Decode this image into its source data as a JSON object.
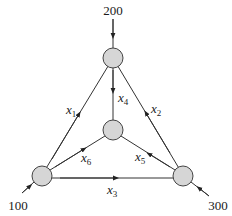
{
  "diagram": {
    "type": "network-flow",
    "colors": {
      "node_fill": "#d6d6d6",
      "stroke": "#333333"
    },
    "external_flows": {
      "top": {
        "label": "200",
        "direction": "in"
      },
      "bottom_left": {
        "label": "100",
        "direction": "in"
      },
      "bottom_right": {
        "label": "300",
        "direction": "out"
      }
    },
    "nodes": [
      "top",
      "center",
      "bottom-left",
      "bottom-right"
    ],
    "edges": [
      {
        "var": "x",
        "sub": "1",
        "from": "bottom-left",
        "to": "top"
      },
      {
        "var": "x",
        "sub": "2",
        "from": "bottom-right",
        "to": "top"
      },
      {
        "var": "x",
        "sub": "3",
        "from": "bottom-left",
        "to": "bottom-right"
      },
      {
        "var": "x",
        "sub": "4",
        "from": "top",
        "to": "center"
      },
      {
        "var": "x",
        "sub": "5",
        "from": "bottom-right",
        "to": "center"
      },
      {
        "var": "x",
        "sub": "6",
        "from": "bottom-left",
        "to": "center"
      }
    ]
  }
}
